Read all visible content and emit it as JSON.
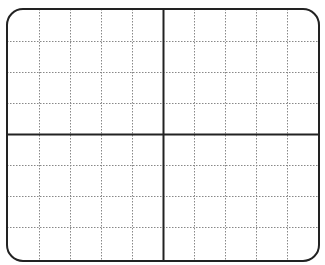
{
  "diagram": {
    "type": "blank-coordinate-grid",
    "frame": {
      "x": 7,
      "y": 9,
      "width": 312,
      "height": 252,
      "corner_radius": 16,
      "stroke": "#222222",
      "stroke_width": 2
    },
    "columns": 10,
    "rows": 8,
    "vertical_lines_x": [
      39,
      70,
      101,
      132,
      163,
      194,
      225,
      256,
      287
    ],
    "horizontal_lines_y": [
      41,
      72,
      103,
      134,
      165,
      196,
      227
    ],
    "axis_x": 163,
    "axis_y": 134,
    "grid_color": "#888888",
    "axis_color": "#222222"
  }
}
